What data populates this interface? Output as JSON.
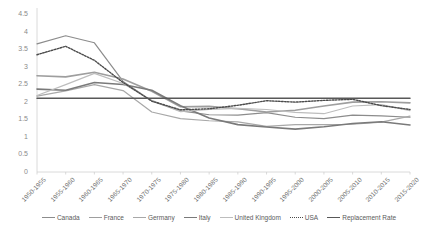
{
  "chart_data": {
    "type": "line",
    "title": "",
    "subtitle": "",
    "xlabel": "",
    "ylabel": "",
    "ylim": [
      0,
      4.5
    ],
    "ytick_labels": [
      "4.5",
      "4",
      "3.5",
      "3",
      "2.5",
      "2",
      "1.5",
      "1",
      "0.5",
      "0"
    ],
    "ytick_values": [
      4.5,
      4,
      3.5,
      3,
      2.5,
      2,
      1.5,
      1,
      0.5,
      0
    ],
    "grid": false,
    "legend_position": "bottom",
    "categories": [
      "1950-1955",
      "1955-1960",
      "1960-1965",
      "1965-1970",
      "1970-1975",
      "1975-1980",
      "1980-1985",
      "1985-1990",
      "1990-1995",
      "1995-2000",
      "2000-2005",
      "2005-2010",
      "2010-2015",
      "2015-2020"
    ],
    "series": [
      {
        "name": "Canada",
        "color": "#8c8c8c",
        "style": "solid",
        "width": 1.2,
        "values": [
          3.65,
          3.88,
          3.68,
          2.58,
          2.02,
          1.74,
          1.63,
          1.62,
          1.69,
          1.56,
          1.52,
          1.62,
          1.6,
          1.56
        ]
      },
      {
        "name": "France",
        "color": "#9e9e9e",
        "style": "solid",
        "width": 1.6,
        "values": [
          2.74,
          2.71,
          2.84,
          2.65,
          2.3,
          1.86,
          1.87,
          1.8,
          1.71,
          1.76,
          1.88,
          1.99,
          2.0,
          1.97
        ]
      },
      {
        "name": "Germany",
        "color": "#a8a8a8",
        "style": "solid",
        "width": 1.2,
        "values": [
          2.16,
          2.31,
          2.49,
          2.32,
          1.71,
          1.52,
          1.46,
          1.43,
          1.3,
          1.35,
          1.35,
          1.36,
          1.42,
          1.59
        ]
      },
      {
        "name": "Italy",
        "color": "#7a7a7a",
        "style": "solid",
        "width": 1.6,
        "values": [
          2.36,
          2.33,
          2.55,
          2.49,
          2.33,
          1.89,
          1.54,
          1.35,
          1.28,
          1.22,
          1.29,
          1.38,
          1.43,
          1.34
        ]
      },
      {
        "name": "United Kingdom",
        "color": "#bdbdbd",
        "style": "solid",
        "width": 1.2,
        "values": [
          2.18,
          2.49,
          2.81,
          2.52,
          2.04,
          1.72,
          1.78,
          1.81,
          1.78,
          1.7,
          1.66,
          1.88,
          1.92,
          1.75
        ]
      },
      {
        "name": "USA",
        "color": "#4a4a4a",
        "style": "dotted",
        "width": 1.4,
        "values": [
          3.34,
          3.58,
          3.18,
          2.55,
          2.02,
          1.77,
          1.8,
          1.9,
          2.03,
          1.99,
          2.04,
          2.07,
          1.89,
          1.78
        ]
      },
      {
        "name": "Replacement Rate",
        "color": "#585858",
        "style": "solid",
        "width": 1.5,
        "values": [
          2.1,
          2.1,
          2.1,
          2.1,
          2.1,
          2.1,
          2.1,
          2.1,
          2.1,
          2.1,
          2.1,
          2.1,
          2.1,
          2.1
        ]
      }
    ]
  },
  "legend": {
    "items": [
      {
        "label": "Canada"
      },
      {
        "label": "France"
      },
      {
        "label": "Germany"
      },
      {
        "label": "Italy"
      },
      {
        "label": "United Kingdom"
      },
      {
        "label": "USA"
      },
      {
        "label": "Replacement Rate"
      }
    ]
  }
}
